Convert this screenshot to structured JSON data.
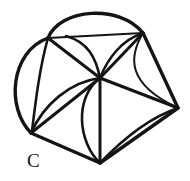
{
  "figure": {
    "label": "C",
    "label_position": {
      "x": 27,
      "y": 151
    },
    "canvas": {
      "width": 190,
      "height": 181
    },
    "stroke_color": "#141414",
    "background_color": "#ffffff",
    "vertices": [
      {
        "name": "upper-left",
        "x": 48,
        "y": 38
      },
      {
        "name": "top-right",
        "x": 143,
        "y": 33
      },
      {
        "name": "right",
        "x": 178,
        "y": 108
      },
      {
        "name": "bottom",
        "x": 100,
        "y": 163
      },
      {
        "name": "bottom-left",
        "x": 31,
        "y": 133
      },
      {
        "name": "hub",
        "x": 100,
        "y": 78
      }
    ],
    "paths": [
      {
        "name": "outer-top-arc",
        "kind": "outer",
        "d": "M 48 38 C 60 8 120 4 143 33"
      },
      {
        "name": "outer-right-upper",
        "kind": "outer",
        "d": "M 143 33 L 178 108"
      },
      {
        "name": "outer-right-lower",
        "kind": "outer",
        "d": "M 178 108 L 100 163"
      },
      {
        "name": "outer-bottom-left",
        "kind": "outer",
        "d": "M 100 163 L 31 133"
      },
      {
        "name": "outer-left-arc",
        "kind": "outer",
        "d": "M 31 133 C 6 108 10 52 48 38"
      },
      {
        "name": "chord-upper-left-to-top-right",
        "kind": "thin",
        "d": "M 48 38 L 143 33"
      },
      {
        "name": "spoke-hub-upper-left",
        "kind": "spoke",
        "d": "M 100 78 L 48 38"
      },
      {
        "name": "spoke-hub-top-right",
        "kind": "spoke",
        "d": "M 100 78 L 143 33"
      },
      {
        "name": "spoke-hub-right",
        "kind": "spoke",
        "d": "M 100 78 L 178 108"
      },
      {
        "name": "spoke-hub-bottom",
        "kind": "spoke",
        "d": "M 100 78 L 100 163"
      },
      {
        "name": "spoke-hub-bottom-left",
        "kind": "spoke",
        "d": "M 100 78 L 31 133"
      },
      {
        "name": "petal-arc-top-center",
        "kind": "inner",
        "d": "M 100 78 C 96 58 88 42 66 36"
      },
      {
        "name": "petal-arc-top-right",
        "kind": "inner",
        "d": "M 100 78 C 108 58 122 40 141 34"
      },
      {
        "name": "petal-arc-right-inner",
        "kind": "thin",
        "d": "M 143 33 C 128 58 128 84 176 107"
      },
      {
        "name": "petal-arc-left-upper",
        "kind": "inner",
        "d": "M 48 38 C 40 66 36 98 32 131"
      },
      {
        "name": "petal-arc-hub-to-bottom-left",
        "kind": "inner",
        "d": "M 100 78 C 70 82 44 104 31 133"
      },
      {
        "name": "petal-arc-hub-to-bottom",
        "kind": "inner",
        "d": "M 100 78 C 74 98 78 142 100 163"
      },
      {
        "name": "petal-arc-bottom-right",
        "kind": "inner",
        "d": "M 100 163 C 122 140 148 118 178 108"
      }
    ]
  }
}
